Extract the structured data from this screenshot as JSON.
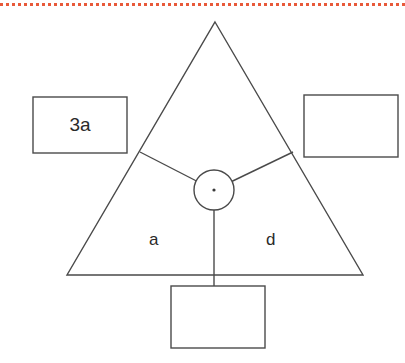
{
  "page": {
    "width": 405,
    "height": 363,
    "background_color": "#ffffff"
  },
  "divider": {
    "name": "dotted-separator-rule",
    "color": "#e8593a",
    "style": "dotted"
  },
  "figure": {
    "stroke_color": "#4a4a4a",
    "fill_color": "#ffffff",
    "triangle": {
      "apex": {
        "x": 215,
        "y": 22
      },
      "bottom_left": {
        "x": 67,
        "y": 275
      },
      "bottom_right": {
        "x": 363,
        "y": 275
      }
    },
    "circle": {
      "center": {
        "x": 214,
        "y": 190
      },
      "radius": 20,
      "center_dot_radius": 1.6
    },
    "spokes": [
      {
        "name": "spoke-upper-left",
        "from": {
          "x": 214,
          "y": 190
        },
        "to": {
          "x": 140,
          "y": 152
        }
      },
      {
        "name": "spoke-upper-right",
        "from": {
          "x": 214,
          "y": 190
        },
        "to": {
          "x": 293,
          "y": 152
        }
      },
      {
        "name": "spoke-down",
        "from": {
          "x": 214,
          "y": 190
        },
        "to": {
          "x": 214,
          "y": 308
        }
      }
    ],
    "labels": [
      {
        "name": "label-a",
        "text": "a"
      },
      {
        "name": "label-d",
        "text": "d"
      }
    ]
  },
  "answer_boxes": {
    "left": {
      "name": "answer-box-left",
      "value": "3a",
      "rect": {
        "x": 33,
        "y": 97,
        "width": 94,
        "height": 56
      }
    },
    "right": {
      "name": "answer-box-right",
      "value": "",
      "rect": {
        "x": 304,
        "y": 95,
        "width": 94,
        "height": 62
      }
    },
    "bottom": {
      "name": "answer-box-bottom",
      "value": "",
      "rect": {
        "x": 171,
        "y": 286,
        "width": 94,
        "height": 62
      }
    }
  }
}
